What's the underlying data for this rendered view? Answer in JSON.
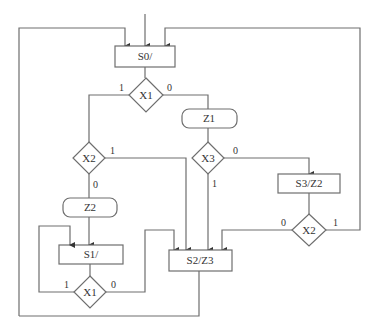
{
  "diagram": {
    "type": "ASM chart",
    "line_color": "#6e6e6e",
    "states": [
      {
        "id": "S0",
        "label": "S0/"
      },
      {
        "id": "S1",
        "label": "S1/"
      },
      {
        "id": "S2",
        "label": "S2/Z3"
      },
      {
        "id": "S3",
        "label": "S3/Z2"
      }
    ],
    "decisions": [
      {
        "id": "x1_top",
        "label": "X1",
        "one": "1",
        "zero": "0"
      },
      {
        "id": "x2_left",
        "label": "X2",
        "one": "1",
        "zero": "0"
      },
      {
        "id": "x3",
        "label": "X3",
        "one": "1",
        "zero": "0"
      },
      {
        "id": "x2_right",
        "label": "X2",
        "one": "1",
        "zero": "0"
      },
      {
        "id": "x1_bottom",
        "label": "X1",
        "one": "1",
        "zero": "0"
      }
    ],
    "outputs": [
      {
        "id": "z1",
        "label": "Z1"
      },
      {
        "id": "z2",
        "label": "Z2"
      }
    ]
  }
}
